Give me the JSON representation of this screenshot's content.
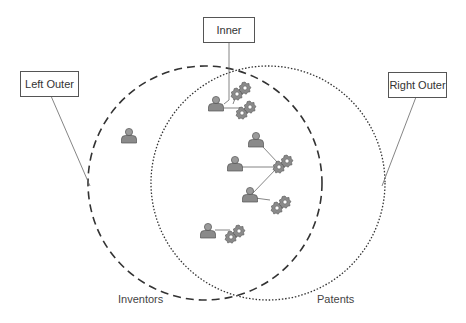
{
  "diagram": {
    "type": "venn",
    "sets": [
      {
        "name": "Inventors",
        "style": "dashed",
        "color": "#333333"
      },
      {
        "name": "Patents",
        "style": "dotted",
        "color": "#333333"
      }
    ],
    "callouts": {
      "left_outer": "Left Outer",
      "inner": "Inner",
      "right_outer": "Right Outer"
    },
    "set_labels": {
      "inventors": "Inventors",
      "patents": "Patents"
    },
    "nodes": {
      "left_only_inventors": 1,
      "intersection_inventors": 6,
      "intersection_patent_clusters": 6
    },
    "icons": {
      "person": "person-icon",
      "patent": "gear-icon"
    },
    "colors": {
      "icon_fill": "#8a8a8a",
      "icon_stroke": "#555555",
      "line": "#555555"
    }
  }
}
